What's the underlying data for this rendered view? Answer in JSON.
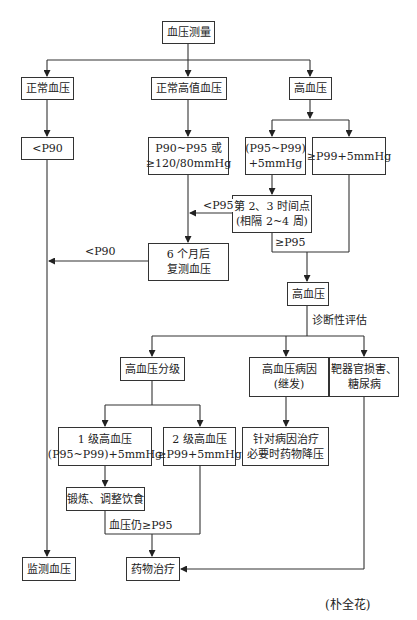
{
  "diagram": {
    "type": "flowchart",
    "title": "",
    "nodes": {
      "measure": "血压测量",
      "normal": "正常血压",
      "high_normal": "正常高值血压",
      "hypertension_top": "高血压",
      "lt_p90": "<P90",
      "p90_p95_line1": "P90~P95 或",
      "p90_p95_line2": "≥120/80mmHg",
      "p95_p99_line1": "(P95~P99)",
      "p95_p99_line2": "+5mmHg",
      "ge_p99": "≥P99+5mmHg",
      "timepoints_line1": "第 2、3 时间点",
      "timepoints_line2": "(相隔 2~4 周)",
      "recheck_line1": "6 个月后",
      "recheck_line2": "复测血压",
      "hypertension_mid": "高血压",
      "grading": "高血压分级",
      "cause_line1": "高血压病因",
      "cause_line2": "(继发)",
      "organ_line1": "靶器官损害、",
      "organ_line2": "糖尿病",
      "grade1_line1": "1 级高血压",
      "grade1_line2": "(P95~P99)+5mmHg",
      "grade2_line1": "2 级高血压",
      "grade2_line2": "≥P99+5mmHg",
      "treat_cause_line1": "针对病因治疗",
      "treat_cause_line2": "必要时药物降压",
      "lifestyle": "锻炼、调整饮食",
      "monitor": "监测血压",
      "drug": "药物治疗"
    },
    "edge_labels": {
      "lt_p95": "<P95",
      "lt_p90": "<P90",
      "ge_p95": "≥P95",
      "diagnostic_eval": "诊断性评估",
      "still_ge_p95": "血压仍≥P95"
    },
    "edges": [
      [
        "measure",
        "normal"
      ],
      [
        "measure",
        "high_normal"
      ],
      [
        "measure",
        "hypertension_top"
      ],
      [
        "normal",
        "lt_p90"
      ],
      [
        "lt_p90",
        "monitor"
      ],
      [
        "high_normal",
        "p90_p95"
      ],
      [
        "p90_p95",
        "recheck"
      ],
      [
        "hypertension_top",
        "p95_p99"
      ],
      [
        "hypertension_top",
        "ge_p99"
      ],
      [
        "p95_p99",
        "timepoints"
      ],
      [
        "timepoints",
        "recheck",
        "<P95"
      ],
      [
        "timepoints",
        "hypertension_mid",
        "≥P95"
      ],
      [
        "ge_p99",
        "hypertension_mid"
      ],
      [
        "recheck",
        "monitor",
        "<P90"
      ],
      [
        "hypertension_mid",
        "grading",
        "诊断性评估"
      ],
      [
        "hypertension_mid",
        "cause"
      ],
      [
        "hypertension_mid",
        "organ"
      ],
      [
        "grading",
        "grade1"
      ],
      [
        "grading",
        "grade2"
      ],
      [
        "cause",
        "treat_cause"
      ],
      [
        "grade1",
        "lifestyle"
      ],
      [
        "lifestyle",
        "drug",
        "血压仍≥P95"
      ],
      [
        "grade2",
        "drug"
      ],
      [
        "organ",
        "drug"
      ]
    ]
  },
  "caption": "(朴全花)"
}
